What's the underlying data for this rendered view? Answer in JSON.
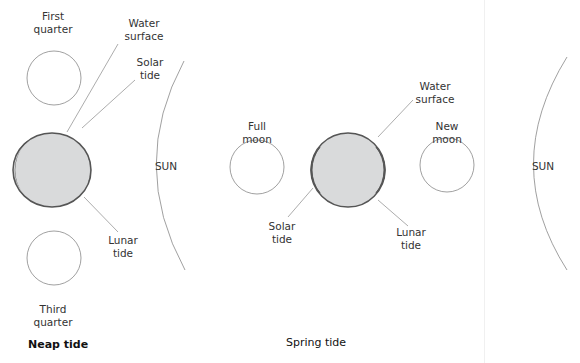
{
  "diagram": {
    "panels": [
      {
        "title": "Neap tide",
        "labels": {
          "first_quarter": "First\nquarter",
          "water_surface": "Water\nsurface",
          "solar_tide": "Solar\ntide",
          "lunar_tide": "Lunar\ntide",
          "third_quarter": "Third\nquarter",
          "sun": "SUN"
        }
      },
      {
        "title": "Spring tide",
        "labels": {
          "full_moon": "Full\nmoon",
          "water_surface": "Water\nsurface",
          "new_moon": "New\nmoon",
          "solar_tide": "Solar\ntide",
          "lunar_tide": "Lunar\ntide",
          "sun": "SUN"
        }
      }
    ],
    "colors": {
      "earth_fill": "#d9dadb",
      "tide_bulge": "#555555",
      "outline": "#888888"
    }
  }
}
